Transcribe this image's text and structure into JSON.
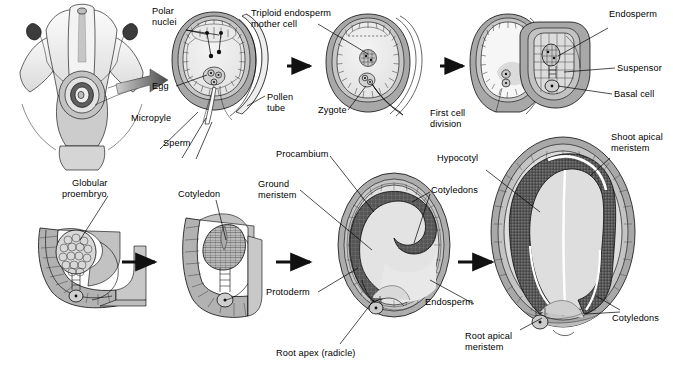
{
  "figure": {
    "background": "#ffffff",
    "ink": "#000000",
    "palette": {
      "integument_dark": "#9a9a9a",
      "integument_mid": "#b4b4b4",
      "endosperm_light": "#d9d9d9",
      "embryo_dark": "#6e6e6e",
      "pale": "#efefef",
      "flower_pale": "#e8e8e8"
    }
  },
  "rows": [
    {
      "name": "top-row",
      "panels": [
        {
          "id": "flower",
          "caption": "",
          "labels": [
            "Polar nuclei",
            "Egg",
            "Micropyle",
            "Sperm"
          ]
        },
        {
          "id": "ovule-embryo-sac",
          "caption": "",
          "labels": [
            "Polar nuclei",
            "Egg",
            "Micropyle",
            "Sperm",
            "Pollen tube"
          ]
        },
        {
          "id": "fertilized-ovule",
          "caption": "",
          "labels": [
            "Triploid endosperm mother cell",
            "Zygote"
          ]
        },
        {
          "id": "first-division",
          "caption": "First cell division",
          "labels": []
        },
        {
          "id": "suspensor-stage",
          "caption": "",
          "labels": [
            "Endosperm",
            "Suspensor",
            "Basal cell"
          ]
        }
      ]
    },
    {
      "name": "bottom-row",
      "panels": [
        {
          "id": "globular",
          "caption": "",
          "labels": [
            "Globular proembryo"
          ]
        },
        {
          "id": "heart-cotyledon",
          "caption": "",
          "labels": [
            "Cotyledon"
          ]
        },
        {
          "id": "torpedo",
          "caption": "",
          "labels": [
            "Procambium",
            "Ground meristem",
            "Protoderm",
            "Root apex (radicle)",
            "Cotyledons",
            "Endosperm"
          ]
        },
        {
          "id": "mature-seed",
          "caption": "",
          "labels": [
            "Shoot apical meristem",
            "Hypocotyl",
            "Cotyledons",
            "Root apical meristem"
          ]
        }
      ]
    }
  ],
  "labels": {
    "polar_nuclei_l1": "Polar",
    "polar_nuclei_l2": "nuclei",
    "egg": "Egg",
    "micropyle": "Micropyle",
    "sperm": "Sperm",
    "pollen_tube_l1": "Pollen",
    "pollen_tube_l2": "tube",
    "triploid_l1": "Triploid endosperm",
    "triploid_l2": "mother cell",
    "zygote": "Zygote",
    "first_cell_l1": "First cell",
    "first_cell_l2": "division",
    "endosperm_top": "Endosperm",
    "suspensor": "Suspensor",
    "basal_cell": "Basal cell",
    "globular_l1": "Globular",
    "globular_l2": "proembryo",
    "cotyledon": "Cotyledon",
    "ground_l1": "Ground",
    "ground_l2": "meristem",
    "procambium": "Procambium",
    "protoderm": "Protoderm",
    "root_apex": "Root apex (radicle)",
    "cotyledons_mid": "Cotyledons",
    "endosperm_mid": "Endosperm",
    "hypocotyl": "Hypocotyl",
    "shoot_l1": "Shoot apical",
    "shoot_l2": "meristem",
    "cotyledons_right": "Cotyledons",
    "root_apical_l1": "Root apical",
    "root_apical_l2": "meristem"
  }
}
